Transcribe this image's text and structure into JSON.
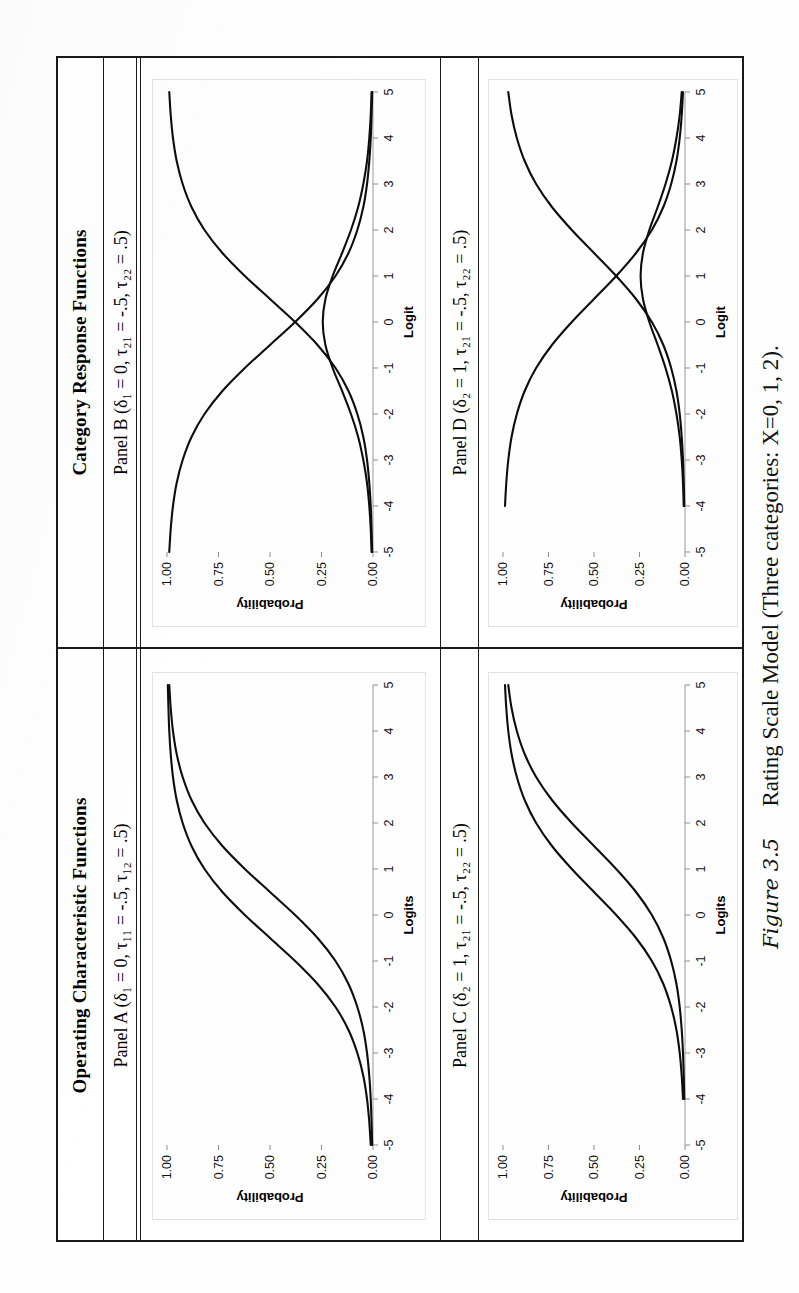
{
  "figure": {
    "number": "Figure 3.5",
    "caption": "Rating Scale Model (Three categories: X=0, 1, 2)."
  },
  "groups": [
    {
      "id": "occ",
      "title": "Operating Characteristic Functions"
    },
    {
      "id": "crf",
      "title": "Category Response Functions"
    }
  ],
  "panels": {
    "A": {
      "label": "Panel A (δ₁ = 0, τ₁₁ = -.5, τ₁₂ = .5)",
      "xlabel": "Logits",
      "ylabel": "Probability"
    },
    "B": {
      "label": "Panel B (δ₁ = 0, τ₂₁ = -.5, τ₂₂ = .5)",
      "xlabel": "Logit",
      "ylabel": "Probability"
    },
    "C": {
      "label": "Panel C (δ₂ = 1, τ₂₁ = -.5, τ₂₂ = .5)",
      "xlabel": "Logits",
      "ylabel": "Probability"
    },
    "D": {
      "label": "Panel D (δ₂ = 1, τ₂₁ = -.5, τ₂₂ = .5)",
      "xlabel": "Logit",
      "ylabel": "Probability"
    }
  },
  "axis": {
    "xticks": [
      "-5",
      "-4",
      "-3",
      "-2",
      "-1",
      "0",
      "1",
      "2",
      "3",
      "4",
      "5"
    ],
    "yticks": [
      "0.00",
      "0.25",
      "0.50",
      "0.75",
      "1.00"
    ]
  },
  "chart_data": [
    {
      "id": "panelA",
      "type": "line",
      "title": "Panel A (δ₁ = 0, τ₁₁ = -.5, τ₁₂ = .5)",
      "xlabel": "Logits",
      "ylabel": "Probability",
      "xlim": [
        -5,
        5
      ],
      "ylim": [
        0,
        1
      ],
      "xticks": [
        -5,
        -4,
        -3,
        -2,
        -1,
        0,
        1,
        2,
        3,
        4,
        5
      ],
      "yticks": [
        0.0,
        0.25,
        0.5,
        0.75,
        1.0
      ],
      "grid": false,
      "legend": "none",
      "x": [
        -5,
        -4.5,
        -4,
        -3.5,
        -3,
        -2.5,
        -2,
        -1.5,
        -1,
        -0.5,
        0,
        0.5,
        1,
        1.5,
        2,
        2.5,
        3,
        3.5,
        4,
        4.5,
        5
      ],
      "series": [
        {
          "name": "P(X>=1)  δ₁+τ₁₁ = -0.5",
          "values": [
            0.011,
            0.018,
            0.029,
            0.047,
            0.076,
            0.119,
            0.182,
            0.269,
            0.378,
            0.5,
            0.622,
            0.731,
            0.818,
            0.881,
            0.924,
            0.953,
            0.971,
            0.982,
            0.989,
            0.993,
            0.996
          ]
        },
        {
          "name": "P(X=2)  δ₁+τ₁₂ = 0.5",
          "values": [
            0.004,
            0.007,
            0.011,
            0.018,
            0.029,
            0.047,
            0.076,
            0.119,
            0.182,
            0.269,
            0.378,
            0.5,
            0.622,
            0.731,
            0.818,
            0.881,
            0.924,
            0.953,
            0.971,
            0.982,
            0.989
          ]
        }
      ]
    },
    {
      "id": "panelB",
      "type": "line",
      "title": "Panel B (δ₁ = 0, τ₂₁ = -.5, τ₂₂ = .5)",
      "xlabel": "Logit",
      "ylabel": "Probability",
      "xlim": [
        -5,
        5
      ],
      "ylim": [
        0,
        1
      ],
      "xticks": [
        -5,
        -4,
        -3,
        -2,
        -1,
        0,
        1,
        2,
        3,
        4,
        5
      ],
      "yticks": [
        0.0,
        0.25,
        0.5,
        0.75,
        1.0
      ],
      "grid": false,
      "legend": "none",
      "x": [
        -5,
        -4.5,
        -4,
        -3.5,
        -3,
        -2.5,
        -2,
        -1.5,
        -1,
        -0.5,
        0,
        0.5,
        1,
        1.5,
        2,
        2.5,
        3,
        3.5,
        4,
        4.5,
        5
      ],
      "series": [
        {
          "name": "P(X=0)",
          "values": [
            0.989,
            0.982,
            0.971,
            0.953,
            0.924,
            0.881,
            0.818,
            0.731,
            0.622,
            0.5,
            0.378,
            0.269,
            0.182,
            0.119,
            0.076,
            0.047,
            0.029,
            0.018,
            0.011,
            0.007,
            0.004
          ]
        },
        {
          "name": "P(X=1)",
          "values": [
            0.007,
            0.011,
            0.018,
            0.029,
            0.047,
            0.072,
            0.107,
            0.15,
            0.196,
            0.231,
            0.244,
            0.231,
            0.196,
            0.15,
            0.107,
            0.072,
            0.047,
            0.029,
            0.018,
            0.011,
            0.007
          ]
        },
        {
          "name": "P(X=2)",
          "values": [
            0.004,
            0.007,
            0.011,
            0.018,
            0.029,
            0.047,
            0.076,
            0.119,
            0.182,
            0.269,
            0.378,
            0.5,
            0.622,
            0.731,
            0.818,
            0.881,
            0.924,
            0.953,
            0.971,
            0.982,
            0.989
          ]
        }
      ]
    },
    {
      "id": "panelC",
      "type": "line",
      "title": "Panel C (δ₂ = 1, τ₂₁ = -.5, τ₂₂ = .5)",
      "xlabel": "Logits",
      "ylabel": "Probability",
      "xlim": [
        -5,
        5
      ],
      "ylim": [
        0,
        1
      ],
      "xticks": [
        -5,
        -4,
        -3,
        -2,
        -1,
        0,
        1,
        2,
        3,
        4,
        5
      ],
      "yticks": [
        0.0,
        0.25,
        0.5,
        0.75,
        1.0
      ],
      "grid": false,
      "legend": "none",
      "x": [
        -4,
        -3.5,
        -3,
        -2.5,
        -2,
        -1.5,
        -1,
        -0.5,
        0,
        0.5,
        1,
        1.5,
        2,
        2.5,
        3,
        3.5,
        4,
        4.5,
        5
      ],
      "series": [
        {
          "name": "P(X>=1)  δ₂+τ₂₁ = 0.5",
          "values": [
            0.011,
            0.018,
            0.029,
            0.047,
            0.076,
            0.119,
            0.182,
            0.269,
            0.378,
            0.5,
            0.622,
            0.731,
            0.818,
            0.881,
            0.924,
            0.953,
            0.971,
            0.982,
            0.989
          ]
        },
        {
          "name": "P(X=2)  δ₂+τ₂₂ = 1.5",
          "values": [
            0.004,
            0.007,
            0.011,
            0.018,
            0.029,
            0.047,
            0.076,
            0.119,
            0.182,
            0.269,
            0.378,
            0.5,
            0.622,
            0.731,
            0.818,
            0.881,
            0.924,
            0.953,
            0.971
          ]
        }
      ]
    },
    {
      "id": "panelD",
      "type": "line",
      "title": "Panel D (δ₂ = 1, τ₂₁ = -.5, τ₂₂ = .5)",
      "xlabel": "Logit",
      "ylabel": "Probability",
      "xlim": [
        -5,
        5
      ],
      "ylim": [
        0,
        1
      ],
      "xticks": [
        -5,
        -4,
        -3,
        -2,
        -1,
        0,
        1,
        2,
        3,
        4,
        5
      ],
      "yticks": [
        0.0,
        0.25,
        0.5,
        0.75,
        1.0
      ],
      "grid": false,
      "legend": "none",
      "x": [
        -4,
        -3.5,
        -3,
        -2.5,
        -2,
        -1.5,
        -1,
        -0.5,
        0,
        0.5,
        1,
        1.5,
        2,
        2.5,
        3,
        3.5,
        4,
        4.5,
        5
      ],
      "series": [
        {
          "name": "P(X=0)",
          "values": [
            0.989,
            0.982,
            0.971,
            0.953,
            0.924,
            0.881,
            0.818,
            0.731,
            0.622,
            0.5,
            0.378,
            0.269,
            0.182,
            0.119,
            0.076,
            0.047,
            0.029,
            0.018,
            0.011
          ]
        },
        {
          "name": "P(X=1)",
          "values": [
            0.007,
            0.011,
            0.018,
            0.029,
            0.047,
            0.072,
            0.107,
            0.15,
            0.196,
            0.231,
            0.244,
            0.231,
            0.196,
            0.15,
            0.107,
            0.072,
            0.047,
            0.029,
            0.018
          ]
        },
        {
          "name": "P(X=2)",
          "values": [
            0.004,
            0.007,
            0.011,
            0.018,
            0.029,
            0.047,
            0.076,
            0.119,
            0.182,
            0.269,
            0.378,
            0.5,
            0.622,
            0.731,
            0.818,
            0.881,
            0.924,
            0.953,
            0.971
          ]
        }
      ]
    }
  ]
}
